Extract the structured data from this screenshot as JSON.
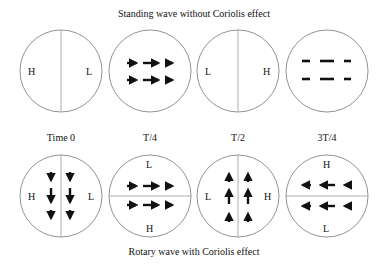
{
  "title_top": "Standing wave without Coriolis effect",
  "title_bottom": "Rotary wave with Coriolis effect",
  "time_labels": [
    "Time  0",
    "T/4",
    "T/2",
    "3T/4"
  ],
  "standing": [
    {
      "time": "Time 0",
      "divider": "vertical",
      "left": "H",
      "right": "L",
      "flow": "none"
    },
    {
      "time": "T/4",
      "divider": "none",
      "flow": "east"
    },
    {
      "time": "T/2",
      "divider": "vertical",
      "left": "L",
      "right": "H",
      "flow": "none"
    },
    {
      "time": "3T/4",
      "divider": "none",
      "flow": "west"
    }
  ],
  "rotary": [
    {
      "time": "Time 0",
      "divider": "vertical",
      "left": "H",
      "right": "L",
      "flow": "south"
    },
    {
      "time": "T/4",
      "divider": "horizontal",
      "top": "L",
      "bottom": "H",
      "flow": "east"
    },
    {
      "time": "T/2",
      "divider": "vertical",
      "left": "L",
      "right": "H",
      "flow": "north"
    },
    {
      "time": "3T/4",
      "divider": "horizontal",
      "top": "H",
      "bottom": "L",
      "flow": "west"
    }
  ],
  "labels": {
    "s0_left": "H",
    "s0_right": "L",
    "s2_left": "L",
    "s2_right": "H",
    "r0_left": "H",
    "r0_right": "L",
    "r1_top": "L",
    "r1_bottom": "H",
    "r2_left": "L",
    "r2_right": "H",
    "r3_top": "H",
    "r3_bottom": "L"
  }
}
